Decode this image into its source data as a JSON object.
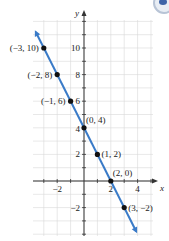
{
  "chart_data": {
    "type": "line",
    "title": "",
    "xlabel": "x",
    "ylabel": "y",
    "xlim": [
      -3.8,
      5.2
    ],
    "ylim": [
      -4.1,
      12.1
    ],
    "grid": true,
    "x_ticks": [
      -2,
      2,
      4
    ],
    "x_tick_labels": [
      "−2",
      "2",
      "4"
    ],
    "y_ticks": [
      -2,
      2,
      4,
      6,
      8,
      10
    ],
    "y_tick_labels": [
      "−2",
      "2",
      "4",
      "6",
      "8",
      "10"
    ],
    "series": [
      {
        "name": "line",
        "equation": "y = -2x + 4",
        "color": "#3a7bc8",
        "x": [
          -3.6,
          3.9
        ],
        "y": [
          11.2,
          -3.8
        ],
        "arrows": "both"
      }
    ],
    "points": [
      {
        "x": -3,
        "y": 10,
        "label": "(−3, 10)",
        "label_pos": "left"
      },
      {
        "x": -2,
        "y": 8,
        "label": "(−2, 8)",
        "label_pos": "left"
      },
      {
        "x": -1,
        "y": 6,
        "label": "(−1, 6)",
        "label_pos": "left"
      },
      {
        "x": 0,
        "y": 4,
        "label": "(0, 4)",
        "label_pos": "upper-right"
      },
      {
        "x": 1,
        "y": 2,
        "label": "(1, 2)",
        "label_pos": "right"
      },
      {
        "x": 2,
        "y": 0,
        "label": "(2, 0)",
        "label_pos": "upper-right"
      },
      {
        "x": 3,
        "y": -2,
        "label": "(3, −2)",
        "label_pos": "right"
      }
    ]
  },
  "colors": {
    "line": "#3a7bc8",
    "grid": "#d9d9d9",
    "axis": "#333333",
    "point": "#111111",
    "text": "#222222"
  }
}
